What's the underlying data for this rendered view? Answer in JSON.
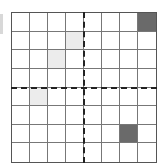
{
  "board": {
    "rows": 8,
    "cols": 8,
    "colors": {
      "dark": "#6a6a6a",
      "light": "#ececec",
      "empty": "#ffffff",
      "line": "#777777",
      "axis": "#222222"
    },
    "cells": [
      {
        "row": 0,
        "col": 7,
        "state": "dark"
      },
      {
        "row": 1,
        "col": 3,
        "state": "light"
      },
      {
        "row": 2,
        "col": 2,
        "state": "light"
      },
      {
        "row": 4,
        "col": 1,
        "state": "light"
      },
      {
        "row": 6,
        "col": 6,
        "state": "dark"
      }
    ],
    "axes": {
      "vertical_after_col": 3,
      "horizontal_after_row": 3,
      "style": "dashed"
    }
  }
}
